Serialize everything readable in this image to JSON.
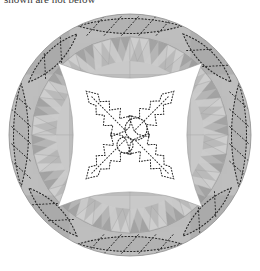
{
  "caption": {
    "text": "shown are not below"
  },
  "figure": {
    "alt": "Grayscale circular quilt design with sawtooth ring and holly motif center",
    "center": {
      "cx": 130,
      "cy": 135
    },
    "radius": 121,
    "palette": {
      "background": "#ffffff",
      "grid_light": "#c9c9c9",
      "grid_mid": "#bdbdbd",
      "grid_dark": "#a9a9a9",
      "band_dark": "#a3a3a3",
      "band_mid": "#b4b4b4",
      "tooth_light": "#cfcfcf",
      "tooth_dark": "#9d9d9d",
      "center_fill": "#ffffff",
      "stitch": "#2b2b2b",
      "outline": "#8a8a8a"
    },
    "grid": {
      "columns": 4,
      "rows": 4,
      "cell": 60.5,
      "shades": [
        [
          "grid_dark",
          "grid_light",
          "grid_light",
          "grid_dark"
        ],
        [
          "grid_light",
          "grid_mid",
          "grid_mid",
          "grid_light"
        ],
        [
          "grid_light",
          "grid_mid",
          "grid_mid",
          "grid_light"
        ],
        [
          "grid_dark",
          "grid_light",
          "grid_light",
          "grid_dark"
        ]
      ]
    },
    "sawtooth_ring": {
      "teeth_count": 32,
      "inner_radius": 74,
      "outer_radius": 98,
      "direction": "points-inward",
      "alternating_shades": [
        "tooth_light",
        "tooth_dark"
      ]
    },
    "outer_band": {
      "inner_radius": 98,
      "outer_radius": 121,
      "fill": "band_mid",
      "stitch_line_radius": 109
    },
    "applique": {
      "leaves": {
        "count": 4,
        "placement_angles_deg": [
          0,
          90,
          180,
          270
        ],
        "shape": "pointed-ellipse",
        "half_length": 52,
        "half_width": 15,
        "center_radius": 109,
        "internal_diagonals": 5
      },
      "diamonds": {
        "count": 4,
        "placement_angles_deg": [
          45,
          135,
          225,
          315
        ],
        "shape": "curved-diamond",
        "half_length": 34,
        "half_width": 15,
        "center_radius": 109,
        "internal_diagonals": 2
      }
    },
    "center_panel": {
      "shape": "astroid",
      "half_size": 72,
      "concavity": 0.42,
      "fill": "center_fill"
    },
    "center_motif": {
      "name": "holly-wreath",
      "leaf_count": 4,
      "leaf_angles_deg": [
        45,
        135,
        225,
        315
      ],
      "leaf_length": 58,
      "leaf_spikes_per_side": 4,
      "berries": [
        {
          "cx": 136,
          "cy": 129,
          "r": 11
        },
        {
          "cx": 125,
          "cy": 145,
          "r": 8
        }
      ],
      "stitch_style": "dotted",
      "stitch_dot_size": 1.1
    }
  }
}
